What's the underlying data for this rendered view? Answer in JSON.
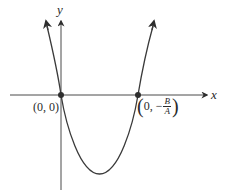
{
  "diagram": {
    "type": "parabola-graph",
    "x_axis_label": "x",
    "y_axis_label": "y",
    "points": [
      {
        "label": "(0, 0)"
      },
      {
        "label_prefix": "0, −",
        "fraction_numerator": "B",
        "fraction_denominator": "A"
      }
    ],
    "colors": {
      "curve": "#3a3a3a",
      "axis": "#3a3a3a",
      "point": "#2e2e2e",
      "background": "#ffffff"
    }
  }
}
